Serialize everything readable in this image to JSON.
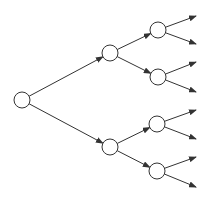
{
  "diagram": {
    "type": "binary-tree",
    "width": 209,
    "height": 200,
    "colors": {
      "stroke": "#333333",
      "node_fill": "#ffffff",
      "background": "#ffffff"
    },
    "node_radius": 8,
    "nodes": [
      {
        "id": "root",
        "level": 0,
        "x": 22,
        "y": 100
      },
      {
        "id": "a",
        "level": 1,
        "x": 110,
        "y": 53
      },
      {
        "id": "b",
        "level": 1,
        "x": 110,
        "y": 147
      },
      {
        "id": "aa",
        "level": 2,
        "x": 158,
        "y": 30
      },
      {
        "id": "ab",
        "level": 2,
        "x": 158,
        "y": 77
      },
      {
        "id": "ba",
        "level": 2,
        "x": 157,
        "y": 124
      },
      {
        "id": "bb",
        "level": 2,
        "x": 157,
        "y": 171
      }
    ],
    "edges": [
      {
        "from": "root",
        "to": "a"
      },
      {
        "from": "root",
        "to": "b"
      },
      {
        "from": "a",
        "to": "aa"
      },
      {
        "from": "a",
        "to": "ab"
      },
      {
        "from": "b",
        "to": "ba"
      },
      {
        "from": "b",
        "to": "bb"
      }
    ],
    "open_arrows": [
      {
        "from": "aa",
        "x": 196,
        "y": 16
      },
      {
        "from": "aa",
        "x": 196,
        "y": 44
      },
      {
        "from": "ab",
        "x": 196,
        "y": 62
      },
      {
        "from": "ab",
        "x": 196,
        "y": 92
      },
      {
        "from": "ba",
        "x": 196,
        "y": 110
      },
      {
        "from": "ba",
        "x": 196,
        "y": 139
      },
      {
        "from": "bb",
        "x": 196,
        "y": 157
      },
      {
        "from": "bb",
        "x": 196,
        "y": 187
      }
    ]
  }
}
